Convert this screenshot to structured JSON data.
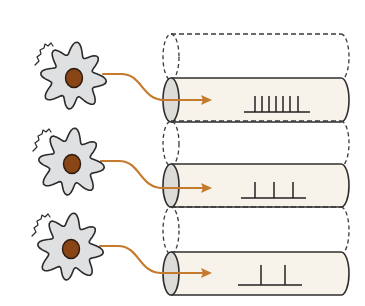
{
  "diagram": {
    "colors": {
      "background": "#ffffff",
      "cell_fill": "#dfe0e2",
      "cell_stroke": "#2b2b2b",
      "nucleus_fill": "#8a4516",
      "nucleus_stroke": "#2b1a0e",
      "axon": "#c57a2d",
      "tube_fill": "#f8f3ea",
      "tube_cap_fill": "#dedcd8",
      "tube_stroke": "#2e2e2e",
      "dashed_stroke": "#3a3a3a",
      "spike": "#222222"
    },
    "rows": [
      {
        "id": "high-rate",
        "cell_center": [
          73,
          77
        ],
        "tube": {
          "top": 78,
          "bottom": 122,
          "left": 171,
          "right": 341
        },
        "dashed_tube": {
          "top": 34,
          "bottom": 80
        },
        "axon_start": [
          103,
          74
        ],
        "axon_end": [
          212,
          100
        ],
        "spike_baseline_y": 112,
        "spike_baseline_x": [
          244,
          310
        ],
        "spike_height": 16,
        "spikes_x": [
          255,
          262,
          269,
          276,
          283,
          290,
          298
        ],
        "spike_count": 7
      },
      {
        "id": "medium-rate",
        "cell_center": [
          71,
          163
        ],
        "tube": {
          "top": 164,
          "bottom": 207,
          "left": 171,
          "right": 341
        },
        "dashed_tube": {
          "top": 121,
          "bottom": 166
        },
        "axon_start": [
          101,
          161
        ],
        "axon_end": [
          212,
          188
        ],
        "spike_baseline_y": 198,
        "spike_baseline_x": [
          241,
          306
        ],
        "spike_height": 16,
        "spikes_x": [
          255,
          274,
          293
        ],
        "spike_count": 3
      },
      {
        "id": "low-rate",
        "cell_center": [
          70,
          248
        ],
        "tube": {
          "top": 252,
          "bottom": 295,
          "left": 171,
          "right": 341
        },
        "dashed_tube": {
          "top": 207,
          "bottom": 254
        },
        "axon_start": [
          100,
          246
        ],
        "axon_end": [
          212,
          273
        ],
        "spike_baseline_y": 285,
        "spike_baseline_x": [
          238,
          302
        ],
        "spike_height": 20,
        "spikes_x": [
          261,
          285
        ],
        "spike_count": 2
      }
    ]
  }
}
